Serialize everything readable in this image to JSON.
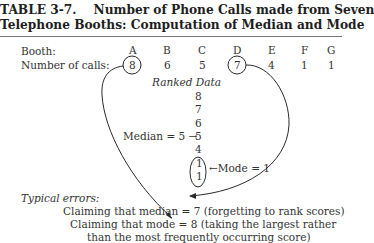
{
  "table": {
    "label": "TABLE 3-7.",
    "title_line1": "Number of Phone Calls made from Seven",
    "title_line2": "Telephone Booths: Computation of Median and Mode"
  },
  "rows": {
    "booth_label": "Booth:",
    "calls_label": "Number of calls:",
    "booths": [
      "A",
      "B",
      "C",
      "D",
      "E",
      "F",
      "G"
    ],
    "calls": [
      "8",
      "6",
      "5",
      "7",
      "4",
      "1",
      "1"
    ],
    "circled": [
      "A",
      "D"
    ]
  },
  "ranked": {
    "heading": "Ranked Data",
    "values": [
      "8",
      "7",
      "6",
      "5",
      "4",
      "1",
      "1"
    ],
    "median_label": "Median = 5 →",
    "mode_label": "←Mode = 1"
  },
  "errors": {
    "heading": "Typical errors:",
    "line1": "Claiming that median = 7 (forgetting to rank scores)",
    "line2": "Claiming that mode = 8 (taking the largest rather",
    "line3": "than the most frequently occurring score)"
  }
}
